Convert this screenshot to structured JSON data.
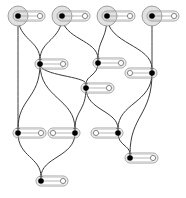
{
  "diagram": {
    "width": 186,
    "height": 198,
    "colors": {
      "background": "#ffffff",
      "edge": "#3a3a3a",
      "node_fill": "#000000",
      "pill_stroke": "#9a9a9a",
      "halo_fill": "#e2e2e2",
      "halo_stroke": "#8a8a8a",
      "port_fill": "#ffffff"
    },
    "nodes": [
      {
        "id": "T1",
        "x": 18,
        "y": 16,
        "root": true,
        "port_x": 40
      },
      {
        "id": "T2",
        "x": 62,
        "y": 16,
        "root": true,
        "port_x": 85
      },
      {
        "id": "T3",
        "x": 107,
        "y": 16,
        "root": true,
        "port_x": 130
      },
      {
        "id": "T4",
        "x": 152,
        "y": 16,
        "root": true,
        "port_x": 174
      },
      {
        "id": "A",
        "x": 40,
        "y": 64,
        "port_x": 63
      },
      {
        "id": "B",
        "x": 98,
        "y": 63,
        "port_x": 121
      },
      {
        "id": "C",
        "x": 152,
        "y": 73,
        "port_x": 130
      },
      {
        "id": "D",
        "x": 86,
        "y": 88,
        "port_x": 109
      },
      {
        "id": "E",
        "x": 18,
        "y": 133,
        "port_x": 41
      },
      {
        "id": "F",
        "x": 75,
        "y": 133,
        "port_x": 53
      },
      {
        "id": "G",
        "x": 118,
        "y": 133,
        "port_x": 96
      },
      {
        "id": "H",
        "x": 41,
        "y": 181,
        "port_x": 63
      },
      {
        "id": "I",
        "x": 130,
        "y": 158,
        "port_x": 153
      }
    ],
    "edges": [
      {
        "from": "T1",
        "to": "E"
      },
      {
        "from": "T1",
        "to": "A"
      },
      {
        "from": "T2",
        "to": "A"
      },
      {
        "from": "T2",
        "to": "B"
      },
      {
        "from": "T3",
        "to": "B"
      },
      {
        "from": "T3",
        "to": "C"
      },
      {
        "from": "T4",
        "to": "C"
      },
      {
        "from": "A",
        "to": "E"
      },
      {
        "from": "A",
        "to": "F"
      },
      {
        "from": "A",
        "to": "D"
      },
      {
        "from": "B",
        "to": "D"
      },
      {
        "from": "D",
        "to": "F"
      },
      {
        "from": "D",
        "to": "G"
      },
      {
        "from": "C",
        "to": "G"
      },
      {
        "from": "C",
        "to": "I"
      },
      {
        "from": "E",
        "to": "H"
      },
      {
        "from": "F",
        "to": "H"
      },
      {
        "from": "G",
        "to": "I"
      }
    ]
  }
}
